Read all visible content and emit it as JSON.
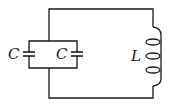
{
  "diagram": {
    "type": "circuit",
    "labels": {
      "capacitor_left": "C",
      "capacitor_right": "C",
      "inductor": "L"
    },
    "colors": {
      "wire": "#1a1a1a",
      "background": "#ffffff"
    }
  }
}
